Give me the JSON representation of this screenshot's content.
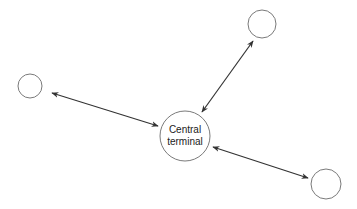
{
  "diagram": {
    "type": "star-network",
    "colors": {
      "node_stroke": "#7a7a7a",
      "link_stroke": "#333333",
      "text": "#222222",
      "background": "#ffffff"
    },
    "central": {
      "label_line1": "Central",
      "label_line2": "terminal",
      "cx": 185,
      "cy": 136,
      "r": 25
    },
    "nodes": [
      {
        "id": "left",
        "cx": 30,
        "cy": 86,
        "r": 12
      },
      {
        "id": "top-right",
        "cx": 262,
        "cy": 24,
        "r": 14
      },
      {
        "id": "bottom-right",
        "cx": 326,
        "cy": 184,
        "r": 15
      }
    ],
    "links": [
      {
        "from": "left",
        "to": "central",
        "bidirectional": true,
        "x1": 52,
        "y1": 93,
        "x2": 158,
        "y2": 126
      },
      {
        "from": "top-right",
        "to": "central",
        "bidirectional": true,
        "x1": 253,
        "y1": 41,
        "x2": 202,
        "y2": 112
      },
      {
        "from": "bottom-right",
        "to": "central",
        "bidirectional": true,
        "x1": 213,
        "y1": 147,
        "x2": 308,
        "y2": 178
      }
    ]
  }
}
